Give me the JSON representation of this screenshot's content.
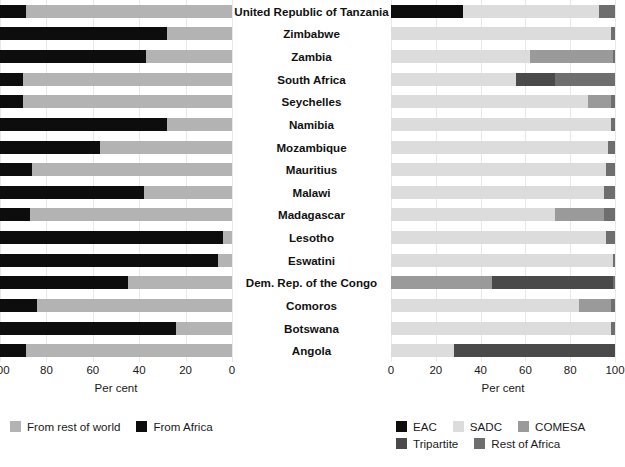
{
  "chart_data": {
    "type": "bar",
    "orientation": "horizontal",
    "stacked": true,
    "title": "",
    "subtitle": "",
    "categories": [
      "United Republic of Tanzania",
      "Zimbabwe",
      "Zambia",
      "South Africa",
      "Seychelles",
      "Namibia",
      "Mozambique",
      "Mauritius",
      "Malawi",
      "Madagascar",
      "Lesotho",
      "Eswatini",
      "Dem. Rep. of the Congo",
      "Comoros",
      "Botswana",
      "Angola"
    ],
    "panels": [
      {
        "id": "left",
        "xlabel": "Per cent",
        "xlim": [
          100,
          0
        ],
        "xticks": [
          100,
          80,
          60,
          40,
          20,
          0
        ],
        "tick_labels": [
          "100",
          "80",
          "60",
          "40",
          "20",
          "0"
        ],
        "reversed_axis": true,
        "grid": true,
        "legend_position": "bottom-left",
        "series": [
          {
            "name": "From rest of world",
            "color": "#b3b3b3",
            "values": [
              89,
              28,
              37,
              90,
              90,
              28,
              57,
              86,
              38,
              87,
              4,
              6,
              45,
              84,
              24,
              89
            ]
          },
          {
            "name": "From Africa",
            "color": "#0d0d0d",
            "values": [
              11,
              72,
              63,
              10,
              10,
              72,
              43,
              14,
              62,
              13,
              96,
              94,
              55,
              16,
              76,
              11
            ]
          }
        ]
      },
      {
        "id": "right",
        "xlabel": "Per cent",
        "xlim": [
          0,
          100
        ],
        "xticks": [
          0,
          20,
          40,
          60,
          80,
          100
        ],
        "tick_labels": [
          "0",
          "20",
          "40",
          "60",
          "80",
          "100"
        ],
        "reversed_axis": false,
        "grid": true,
        "legend_position": "bottom-right",
        "series": [
          {
            "name": "EAC",
            "color": "#0d0d0d",
            "values": [
              32,
              0,
              0,
              0,
              0,
              0,
              0,
              0,
              0,
              0,
              0,
              0,
              0,
              0,
              0,
              0
            ]
          },
          {
            "name": "SADC",
            "color": "#dcdcdc",
            "values": [
              61,
              98,
              62,
              56,
              88,
              98,
              97,
              96,
              95,
              73,
              96,
              99,
              0,
              84,
              98,
              28
            ]
          },
          {
            "name": "COMESA",
            "color": "#9a9a9a",
            "values": [
              0,
              0,
              37,
              0,
              10,
              0,
              0,
              0,
              0,
              22,
              0,
              0,
              45,
              14,
              0,
              0
            ]
          },
          {
            "name": "Tripartite",
            "color": "#4a4a4a",
            "values": [
              0,
              0,
              0,
              17,
              0,
              0,
              0,
              0,
              0,
              0,
              0,
              0,
              54,
              0,
              0,
              72
            ]
          },
          {
            "name": "Rest of Africa",
            "color": "#6e6e6e",
            "values": [
              7,
              2,
              1,
              27,
              2,
              2,
              3,
              4,
              5,
              5,
              4,
              1,
              1,
              2,
              2,
              0
            ]
          }
        ]
      }
    ]
  },
  "left_panel": {
    "axis_title": "Per cent",
    "ticks": [
      "100",
      "80",
      "60",
      "40",
      "20",
      "0"
    ]
  },
  "right_panel": {
    "axis_title": "Per cent",
    "ticks": [
      "0",
      "20",
      "40",
      "60",
      "80",
      "100"
    ]
  },
  "legend_left": {
    "items": [
      {
        "label": "From rest of world",
        "color": "#b3b3b3",
        "icon": "legend-swatch-icon"
      },
      {
        "label": "From Africa",
        "color": "#0d0d0d",
        "icon": "legend-swatch-icon"
      }
    ]
  },
  "legend_right": {
    "row1": [
      {
        "label": "EAC",
        "color": "#0d0d0d",
        "icon": "legend-swatch-icon"
      },
      {
        "label": "SADC",
        "color": "#dcdcdc",
        "icon": "legend-swatch-icon"
      },
      {
        "label": "COMESA",
        "color": "#9a9a9a",
        "icon": "legend-swatch-icon"
      }
    ],
    "row2": [
      {
        "label": "Tripartite",
        "color": "#4a4a4a",
        "icon": "legend-swatch-icon"
      },
      {
        "label": "Rest of Africa",
        "color": "#6e6e6e",
        "icon": "legend-swatch-icon"
      }
    ]
  }
}
